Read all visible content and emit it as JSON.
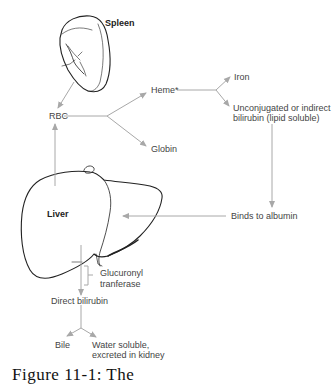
{
  "diagram": {
    "organs": {
      "spleen": "Spleen",
      "liver": "Liver"
    },
    "nodes": {
      "rbc": "RBC",
      "heme": "Heme*",
      "globin": "Globin",
      "iron": "Iron",
      "unconjugated_line1": "Unconjugated or indirect",
      "unconjugated_line2": "bilirubin (lipid soluble)",
      "albumin": "Binds to albumin",
      "enzyme_line1": "Glucuronyl",
      "enzyme_line2": "tranferase",
      "direct": "Direct bilirubin",
      "bile": "Bile",
      "kidney_line1": "Water soluble,",
      "kidney_line2": "excreted in kidney"
    },
    "edges": [
      {
        "from": "Spleen",
        "to": "RBC"
      },
      {
        "from": "RBC",
        "to": "Heme*"
      },
      {
        "from": "RBC",
        "to": "Globin"
      },
      {
        "from": "Heme*",
        "to": "Iron"
      },
      {
        "from": "Heme*",
        "to": "Unconjugated or indirect bilirubin (lipid soluble)"
      },
      {
        "from": "Unconjugated or indirect bilirubin (lipid soluble)",
        "to": "Binds to albumin"
      },
      {
        "from": "Binds to albumin",
        "to": "Liver"
      },
      {
        "from": "Liver",
        "to": "RBC"
      },
      {
        "from": "Liver",
        "to": "Direct bilirubin",
        "via": "Glucuronyl tranferase"
      },
      {
        "from": "Direct bilirubin",
        "to": "Bile"
      },
      {
        "from": "Direct bilirubin",
        "to": "Water soluble, excreted in kidney"
      }
    ],
    "colors": {
      "arrow": "#a8a8a8",
      "outline": "#222222",
      "text": "#444444"
    }
  },
  "caption": "Figure 11-1: The"
}
